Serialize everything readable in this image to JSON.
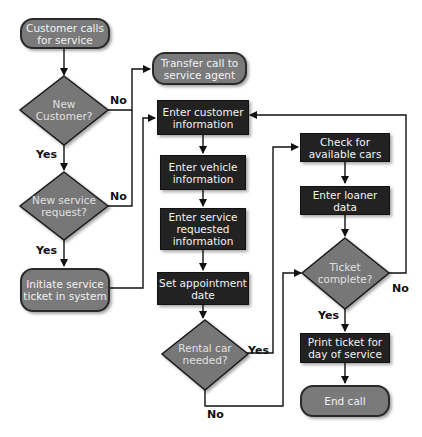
{
  "diagram": {
    "type": "flowchart",
    "colors": {
      "terminal": "#7a7a7a",
      "process": "#222222",
      "decision": "#777777",
      "line": "#111111"
    },
    "nodes": {
      "start": {
        "label": "Customer calls for service",
        "shape": "terminal"
      },
      "new_customer": {
        "label": "New Customer?",
        "shape": "decision"
      },
      "transfer": {
        "label": "Transfer call to service agent",
        "shape": "terminal"
      },
      "new_request": {
        "label": "New service request?",
        "shape": "decision"
      },
      "initiate": {
        "label": "Initiate service ticket in system",
        "shape": "terminal"
      },
      "enter_customer": {
        "label": "Enter customer information",
        "shape": "process"
      },
      "enter_vehicle": {
        "label": "Enter vehicle information",
        "shape": "process"
      },
      "enter_service": {
        "label": "Enter service requested information",
        "shape": "process"
      },
      "set_date": {
        "label": "Set appointment date",
        "shape": "process"
      },
      "rental": {
        "label": "Rental car needed?",
        "shape": "decision"
      },
      "check_cars": {
        "label": "Check for available cars",
        "shape": "process"
      },
      "loaner": {
        "label": "Enter loaner data",
        "shape": "process"
      },
      "ticket_complete": {
        "label": "Ticket complete?",
        "shape": "decision"
      },
      "print": {
        "label": "Print ticket for day of service",
        "shape": "process"
      },
      "end": {
        "label": "End call",
        "shape": "terminal"
      }
    },
    "edge_labels": {
      "new_customer_no": "No",
      "new_customer_yes": "Yes",
      "new_request_no": "No",
      "new_request_yes": "Yes",
      "rental_yes": "Yes",
      "rental_no": "No",
      "ticket_no": "No",
      "ticket_yes": "Yes"
    },
    "edges": [
      {
        "from": "start",
        "to": "new_customer"
      },
      {
        "from": "new_customer",
        "to": "transfer",
        "label": "No"
      },
      {
        "from": "new_customer",
        "to": "new_request",
        "label": "Yes"
      },
      {
        "from": "new_request",
        "to": "transfer",
        "label": "No"
      },
      {
        "from": "new_request",
        "to": "initiate",
        "label": "Yes"
      },
      {
        "from": "initiate",
        "to": "enter_customer"
      },
      {
        "from": "enter_customer",
        "to": "enter_vehicle"
      },
      {
        "from": "enter_vehicle",
        "to": "enter_service"
      },
      {
        "from": "enter_service",
        "to": "set_date"
      },
      {
        "from": "set_date",
        "to": "rental"
      },
      {
        "from": "rental",
        "to": "check_cars",
        "label": "Yes"
      },
      {
        "from": "rental",
        "to": "ticket_complete",
        "label": "No"
      },
      {
        "from": "check_cars",
        "to": "loaner"
      },
      {
        "from": "loaner",
        "to": "ticket_complete"
      },
      {
        "from": "ticket_complete",
        "to": "enter_customer",
        "label": "No"
      },
      {
        "from": "ticket_complete",
        "to": "print",
        "label": "Yes"
      },
      {
        "from": "print",
        "to": "end"
      }
    ]
  }
}
